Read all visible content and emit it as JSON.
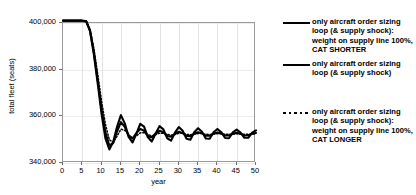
{
  "chart_data": {
    "type": "line",
    "title": "",
    "xlabel": "year",
    "ylabel": "total fleet (seats)",
    "xlim": [
      0,
      50
    ],
    "ylim": [
      340000,
      400000
    ],
    "xticks": [
      0,
      5,
      10,
      15,
      20,
      25,
      30,
      35,
      40,
      45,
      50
    ],
    "yticks": [
      340000,
      360000,
      380000,
      400000
    ],
    "ytick_labels": [
      "340,000",
      "360,000",
      "380,000",
      "400,000"
    ],
    "xtick_labels": [
      "0",
      "5",
      "10",
      "15",
      "20",
      "25",
      "30",
      "35",
      "40",
      "45",
      "50"
    ],
    "grid": "vertical gridlines at every x tick, light horizontal gridlines at y ticks",
    "legend_position": "right, outside plot area",
    "series": [
      {
        "name": "only aircraft order sizing loop (& supply shock): weight on supply line 100%, CAT SHORTER",
        "style": "solid",
        "color": "#000000",
        "x": [
          0,
          1,
          2,
          3,
          4,
          5,
          6,
          7,
          8,
          9,
          10,
          11,
          12,
          13,
          14,
          15,
          16,
          17,
          18,
          19,
          20,
          21,
          22,
          23,
          24,
          25,
          26,
          27,
          28,
          29,
          30,
          31,
          32,
          33,
          34,
          35,
          36,
          37,
          38,
          39,
          40,
          41,
          42,
          43,
          44,
          45,
          46,
          47,
          48,
          49,
          50
        ],
        "y": [
          401000,
          401000,
          401000,
          401000,
          401000,
          401000,
          400800,
          396500,
          386500,
          374000,
          361000,
          350500,
          345800,
          349000,
          355500,
          360500,
          357000,
          351200,
          348800,
          352500,
          356800,
          355600,
          351000,
          349200,
          352600,
          355800,
          354400,
          350600,
          349600,
          353000,
          355400,
          353800,
          350400,
          350000,
          353200,
          354900,
          353400,
          350500,
          350400,
          353200,
          354600,
          353200,
          350700,
          350600,
          353100,
          354300,
          353000,
          350800,
          350800,
          353000,
          354000
        ]
      },
      {
        "name": "only aircraft order sizing loop (& supply shock)",
        "style": "solid",
        "color": "#000000",
        "x": [
          0,
          1,
          2,
          3,
          4,
          5,
          6,
          7,
          8,
          9,
          10,
          11,
          12,
          13,
          14,
          15,
          16,
          17,
          18,
          19,
          20,
          21,
          22,
          23,
          24,
          25,
          26,
          27,
          28,
          29,
          30,
          31,
          32,
          33,
          34,
          35,
          36,
          37,
          38,
          39,
          40,
          41,
          42,
          43,
          44,
          45,
          46,
          47,
          48,
          49,
          50
        ],
        "y": [
          401000,
          401000,
          401000,
          401000,
          401000,
          401000,
          400700,
          396800,
          387500,
          375500,
          363000,
          353000,
          347500,
          348500,
          353500,
          357500,
          355500,
          351800,
          350500,
          352800,
          354600,
          353800,
          351500,
          351000,
          352600,
          353800,
          353200,
          351600,
          351300,
          352500,
          353400,
          352800,
          351600,
          351500,
          352500,
          353200,
          352700,
          351700,
          351700,
          352500,
          353100,
          352600,
          351800,
          351800,
          352500,
          353000,
          352500,
          351800,
          351900,
          352500,
          352900
        ]
      },
      {
        "name": "only aircraft order sizing loop (& supply shock): weight on supply line 100%, CAT LONGER",
        "style": "dotted",
        "color": "#000000",
        "x": [
          0,
          1,
          2,
          3,
          4,
          5,
          6,
          7,
          8,
          9,
          10,
          11,
          12,
          13,
          14,
          15,
          16,
          17,
          18,
          19,
          20,
          21,
          22,
          23,
          24,
          25,
          26,
          27,
          28,
          29,
          30,
          31,
          32,
          33,
          34,
          35,
          36,
          37,
          38,
          39,
          40,
          41,
          42,
          43,
          44,
          45,
          46,
          47,
          48,
          49,
          50
        ],
        "y": [
          401000,
          401000,
          401000,
          401000,
          401000,
          401000,
          400900,
          397500,
          389000,
          378000,
          366500,
          356500,
          350000,
          348800,
          351500,
          354500,
          354000,
          352000,
          350800,
          351600,
          352900,
          353000,
          352200,
          351600,
          352100,
          352800,
          352800,
          352300,
          351900,
          352200,
          352700,
          352700,
          352300,
          352100,
          352300,
          352600,
          352600,
          352300,
          352200,
          352400,
          352600,
          352500,
          352300,
          352300,
          352400,
          352500,
          352400,
          352300,
          352300,
          352400,
          352500
        ]
      }
    ]
  },
  "axes": {
    "x_title": "year",
    "y_title": "total fleet (seats)"
  },
  "legend": {
    "entries": [
      {
        "marker": "solid-line",
        "text": "only aircraft order sizing loop (& supply shock):  weight on supply line 100%, CAT SHORTER"
      },
      {
        "marker": "solid-line",
        "text": "only aircraft order sizing loop (& supply shock)"
      },
      {
        "marker": "dotted-line",
        "text": "only aircraft order sizing loop (& supply shock):  weight on supply line 100%, CAT LONGER"
      }
    ]
  }
}
